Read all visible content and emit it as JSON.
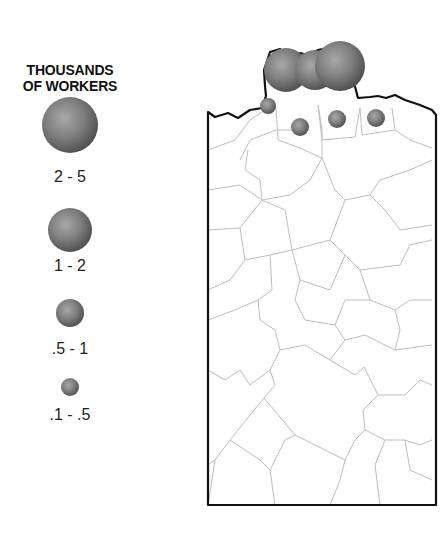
{
  "legend": {
    "title_line1": "THOUSANDS",
    "title_line2": "OF WORKERS",
    "items": [
      {
        "label": "2 - 5",
        "size_class": "largest"
      },
      {
        "label": "1 - 2",
        "size_class": "large"
      },
      {
        "label": ".5 - 1",
        "size_class": "medium"
      },
      {
        "label": ".1 - .5",
        "size_class": "small"
      }
    ]
  },
  "map": {
    "description": "County outline map with proportional circles concentrated along the northern border",
    "circles": [
      {
        "category": "2 - 5",
        "note": "north border cluster, west"
      },
      {
        "category": "2 - 5",
        "note": "north border cluster, middle"
      },
      {
        "category": "2 - 5",
        "note": "north border cluster, east"
      },
      {
        "category": ".1 - .5",
        "note": "northwest border"
      },
      {
        "category": ".5 - 1",
        "note": "north county"
      },
      {
        "category": ".5 - 1",
        "note": "north county"
      },
      {
        "category": ".5 - 1",
        "note": "north county"
      }
    ]
  },
  "colors": {
    "circle_fill": "#7a7a7a",
    "border": "#111111",
    "county_lines": "#b8b8b8"
  }
}
